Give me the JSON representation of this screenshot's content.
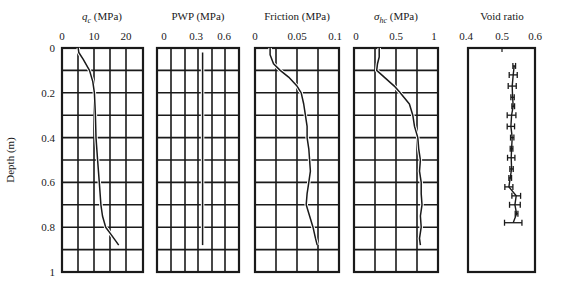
{
  "chart_data": [
    {
      "type": "line",
      "title": "q_c (MPa)",
      "title_main": "q",
      "title_sub": "c",
      "title_unit": " (MPa)",
      "xlabel": "q_c (MPa)",
      "ylabel": "Depth (m)",
      "xlim": [
        0,
        25
      ],
      "ylim": [
        0,
        1
      ],
      "xticks": [
        0,
        10,
        20
      ],
      "yticks": [
        0,
        0.2,
        0.4,
        0.6,
        0.8,
        1
      ],
      "grid": true,
      "grid_x": [
        5,
        10,
        15,
        20
      ],
      "series": [
        {
          "name": "q_c",
          "depth": [
            0,
            0.02,
            0.05,
            0.1,
            0.15,
            0.2,
            0.3,
            0.4,
            0.5,
            0.6,
            0.7,
            0.75,
            0.8,
            0.83,
            0.86,
            0.88
          ],
          "values": [
            5,
            5.2,
            6.5,
            8.5,
            9.5,
            10,
            10.3,
            10.5,
            11,
            11.5,
            12,
            12.5,
            13.5,
            15,
            16.5,
            17.5
          ]
        }
      ]
    },
    {
      "type": "line",
      "title": "PWP (MPa)",
      "xlabel": "PWP (MPa)",
      "xlim": [
        -0.15,
        0.75
      ],
      "ylim": [
        0,
        1
      ],
      "xticks": [
        0,
        0.3,
        0.6
      ],
      "grid": true,
      "series": [
        {
          "name": "PWP",
          "depth": [
            0.02,
            0.88
          ],
          "values": [
            0.35,
            0.35
          ]
        }
      ]
    },
    {
      "type": "line",
      "title": "Friction (MPa)",
      "xlabel": "Friction (MPa)",
      "xlim": [
        0,
        0.1
      ],
      "ylim": [
        0,
        1
      ],
      "xticks": [
        0,
        0.05,
        0.1
      ],
      "grid": true,
      "series": [
        {
          "name": "Friction",
          "depth": [
            0,
            0.03,
            0.07,
            0.1,
            0.13,
            0.17,
            0.2,
            0.25,
            0.3,
            0.35,
            0.4,
            0.45,
            0.5,
            0.55,
            0.6,
            0.65,
            0.7,
            0.75,
            0.8,
            0.85,
            0.88
          ],
          "values": [
            0.018,
            0.018,
            0.022,
            0.03,
            0.04,
            0.05,
            0.055,
            0.058,
            0.06,
            0.062,
            0.062,
            0.064,
            0.065,
            0.066,
            0.064,
            0.062,
            0.061,
            0.065,
            0.069,
            0.072,
            0.074
          ]
        }
      ]
    },
    {
      "type": "line",
      "title": "σ_hc (MPa)",
      "title_main": "σ",
      "title_sub": "hc",
      "title_unit": " (MPa)",
      "xlabel": "σ_hc (MPa)",
      "xlim": [
        0,
        1
      ],
      "ylim": [
        0,
        1
      ],
      "xticks": [
        0,
        0.5,
        1
      ],
      "grid": true,
      "series": [
        {
          "name": "σ_hc",
          "depth": [
            0,
            0.04,
            0.07,
            0.1,
            0.13,
            0.17,
            0.2,
            0.25,
            0.3,
            0.35,
            0.4,
            0.45,
            0.5,
            0.55,
            0.6,
            0.65,
            0.7,
            0.75,
            0.8,
            0.85,
            0.88
          ],
          "values": [
            0.3,
            0.3,
            0.28,
            0.27,
            0.36,
            0.48,
            0.55,
            0.66,
            0.7,
            0.72,
            0.76,
            0.77,
            0.79,
            0.78,
            0.8,
            0.8,
            0.81,
            0.79,
            0.8,
            0.78,
            0.79
          ]
        }
      ]
    },
    {
      "type": "scatter",
      "title": "Void ratio",
      "xlabel": "Void ratio",
      "xlim": [
        0.4,
        0.6
      ],
      "ylim": [
        0,
        1
      ],
      "xticks": [
        0.4,
        0.5,
        0.6
      ],
      "grid": false,
      "series": [
        {
          "name": "Void ratio",
          "depth": [
            0.08,
            0.12,
            0.17,
            0.22,
            0.26,
            0.3,
            0.35,
            0.4,
            0.45,
            0.49,
            0.54,
            0.58,
            0.62,
            0.66,
            0.7,
            0.74,
            0.78
          ],
          "values": [
            0.538,
            0.535,
            0.532,
            0.533,
            0.535,
            0.53,
            0.528,
            0.532,
            0.53,
            0.529,
            0.53,
            0.526,
            0.522,
            0.544,
            0.54,
            0.545,
            0.535
          ],
          "error": [
            0.004,
            0.012,
            0.012,
            0.005,
            0.004,
            0.013,
            0.011,
            0.005,
            0.004,
            0.011,
            0.005,
            0.004,
            0.012,
            0.013,
            0.016,
            0.004,
            0.026
          ]
        }
      ]
    }
  ],
  "labels": {
    "depth_axis": "Depth (m)",
    "depth_ticks": [
      "0",
      "0.2",
      "0.4",
      "0.6",
      "0.8",
      "1"
    ],
    "panel1_title_main": "q",
    "panel1_title_sub": "c",
    "panel1_title_unit": " (MPa)",
    "panel1_ticks": [
      "0",
      "10",
      "20"
    ],
    "panel2_title": "PWP (MPa)",
    "panel2_ticks": [
      "0",
      "0.3",
      "0.6"
    ],
    "panel3_title": "Friction (MPa)",
    "panel3_ticks": [
      "0",
      "0.05",
      "0.1"
    ],
    "panel4_title_main": "σ",
    "panel4_title_sub": "hc",
    "panel4_title_unit": " (MPa)",
    "panel4_ticks": [
      "0",
      "0.5",
      "1"
    ],
    "panel5_title": "Void ratio",
    "panel5_ticks": [
      "0.4",
      "0.5",
      "0.6"
    ]
  },
  "colors": {
    "ink": "#1a1a1a",
    "background": "#ffffff"
  }
}
